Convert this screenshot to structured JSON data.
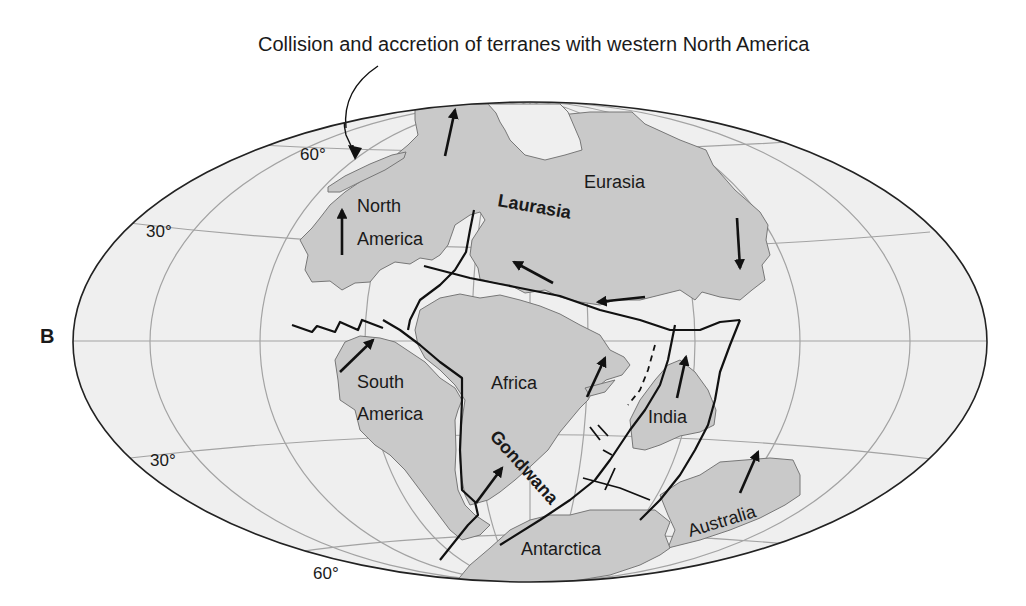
{
  "figure": {
    "panel_letter": "B",
    "annotation": "Collision and accretion of terranes with western North America",
    "colors": {
      "ocean": "#eeeeee",
      "land": "#c8c8c8",
      "graticule": "#9a9a9a",
      "boundary": "#111111",
      "text": "#1a1a1a"
    },
    "latitude_labels": [
      {
        "text": "60°",
        "hemisphere": "north"
      },
      {
        "text": "30°",
        "hemisphere": "north"
      },
      {
        "text": "30°",
        "hemisphere": "south"
      },
      {
        "text": "60°",
        "hemisphere": "south"
      }
    ],
    "continents": [
      {
        "name": "North America"
      },
      {
        "name": "Eurasia"
      },
      {
        "name": "South America"
      },
      {
        "name": "Africa"
      },
      {
        "name": "India"
      },
      {
        "name": "Australia"
      },
      {
        "name": "Antarctica"
      }
    ],
    "supercontinents": [
      {
        "name": "Laurasia"
      },
      {
        "name": "Gondwana"
      }
    ],
    "labels": {
      "north_america_1": "North",
      "north_america_2": "America",
      "eurasia": "Eurasia",
      "laurasia": "Laurasia",
      "south_america_1": "South",
      "south_america_2": "America",
      "africa": "Africa",
      "india": "India",
      "gondwana": "Gondwana",
      "australia": "Australia",
      "antarctica": "Antarctica"
    },
    "lat_labels": {
      "n60": "60°",
      "n30": "30°",
      "s30": "30°",
      "s60": "60°"
    },
    "motion_arrows": [
      {
        "plate": "North America",
        "direction": "north"
      },
      {
        "plate": "Greenland/Laurasia north",
        "direction": "north"
      },
      {
        "plate": "Eurasia east",
        "direction": "south"
      },
      {
        "plate": "Eurasia central",
        "direction": "northwest"
      },
      {
        "plate": "Eurasia south",
        "direction": "west"
      },
      {
        "plate": "South America",
        "direction": "northeast"
      },
      {
        "plate": "Africa",
        "direction": "northeast"
      },
      {
        "plate": "India",
        "direction": "north"
      },
      {
        "plate": "Africa/Gondwana south",
        "direction": "northeast"
      },
      {
        "plate": "Australia",
        "direction": "northeast"
      }
    ]
  }
}
